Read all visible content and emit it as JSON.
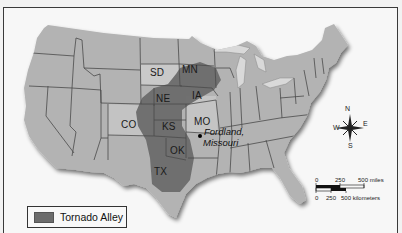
{
  "map": {
    "title": "Tornado Alley map of the United States",
    "colors": {
      "land": "#b3b3b3",
      "tornado_alley": "#6c6c6c",
      "border": "#4a4a4a",
      "water": "#d8d8d8",
      "background": "#f7f7f7"
    },
    "state_labels": [
      {
        "id": "sd",
        "text": "SD"
      },
      {
        "id": "mn",
        "text": "MN"
      },
      {
        "id": "ne",
        "text": "NE"
      },
      {
        "id": "ia",
        "text": "IA"
      },
      {
        "id": "co",
        "text": "CO"
      },
      {
        "id": "ks",
        "text": "KS"
      },
      {
        "id": "mo",
        "text": "MO"
      },
      {
        "id": "ok",
        "text": "OK"
      },
      {
        "id": "tx",
        "text": "TX"
      }
    ],
    "city": {
      "line1": "Fordland,",
      "line2": "Missouri"
    },
    "legend": {
      "label": "Tornado Alley"
    },
    "compass": {
      "n": "N",
      "s": "S",
      "e": "E",
      "w": "W"
    },
    "scale_bar": {
      "miles_ticks": [
        "0",
        "250",
        "500 miles"
      ],
      "km_ticks": [
        "0",
        "250",
        "500 kilometers"
      ]
    },
    "caption_cutoff": "Fordland, Missouri, is near a part of the United States called \"Tornado Alley.\""
  }
}
